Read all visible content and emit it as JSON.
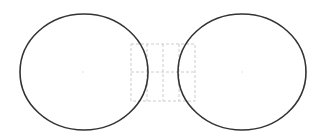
{
  "diagram": {
    "canvas": {
      "width": 322,
      "height": 140,
      "background": "#ffffff"
    },
    "shapes": [
      {
        "id": "left-ellipse",
        "type": "ellipse",
        "cx": 84,
        "cy": 72,
        "rx": 64,
        "ry": 58,
        "stroke": "#333333",
        "stroke_width": 1.6
      },
      {
        "id": "right-ellipse",
        "type": "ellipse",
        "cx": 242,
        "cy": 72,
        "rx": 64,
        "ry": 58,
        "stroke": "#333333",
        "stroke_width": 1.6
      }
    ],
    "center_points": [
      {
        "id": "left-center",
        "x": 83,
        "y": 72
      },
      {
        "id": "right-center",
        "x": 242,
        "y": 72
      }
    ],
    "dashed_grid": {
      "x": 131,
      "y": 44,
      "width": 64,
      "height": 57,
      "vertical_lines": [
        147,
        163,
        179
      ],
      "horizontal_lines": [
        72
      ],
      "stroke": "#cccccc",
      "dash": "3,2"
    }
  }
}
